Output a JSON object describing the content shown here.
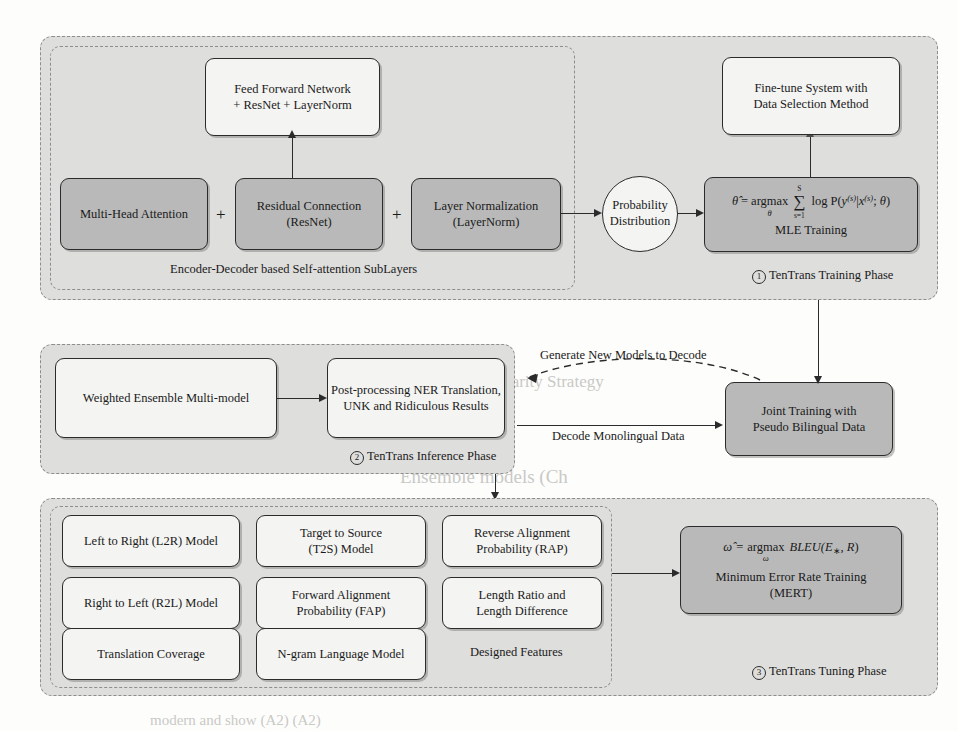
{
  "phase1": {
    "caption_number": "1",
    "caption": "TenTrans Training Phase",
    "subgroup_caption": "Encoder-Decoder based Self-attention SubLayers",
    "boxes": {
      "feed_forward": "Feed Forward Network\n+ ResNet + LayerNorm",
      "feed_forward_l1": "Feed Forward Network",
      "feed_forward_l2": "+ ResNet + LayerNorm",
      "multi_head": "Multi-Head Attention",
      "residual_l1": "Residual Connection",
      "residual_l2": "(ResNet)",
      "layernorm_l1": "Layer Normalization",
      "layernorm_l2": "(LayerNorm)",
      "finetune_l1": "Fine-tune System with",
      "finetune_l2": "Data Selection Method",
      "prob_l1": "Probability",
      "prob_l2": "Distribution",
      "mle_caption": "MLE Training"
    },
    "operators": {
      "plus1": "+",
      "plus2": "+"
    },
    "mle_formula": {
      "theta_hat": "θ̂",
      "equals": "=",
      "argmax": "argmax",
      "argmax_under": "θ",
      "sum": "∑",
      "sum_top": "S",
      "sum_bottom": "s=1",
      "log": "log",
      "body": "P(y(s)|x(s); θ)"
    }
  },
  "phase2": {
    "caption_number": "2",
    "caption": "TenTrans Inference Phase",
    "boxes": {
      "ensemble": "Weighted Ensemble Multi-model",
      "postproc_l1": "Post-processing NER Translation,",
      "postproc_l2": "UNK and Ridiculous Results"
    }
  },
  "joint": {
    "box_l1": "Joint Training with",
    "box_l2": "Pseudo Bilingual Data"
  },
  "edges": {
    "generate_models": "Generate New Models to Decode",
    "decode_mono": "Decode Monolingual Data"
  },
  "phase3": {
    "caption_number": "3",
    "caption": "TenTrans Tuning Phase",
    "subgroup_caption": "Designed Features",
    "features": [
      {
        "l1": "Left to Right (L2R) Model",
        "l2": ""
      },
      {
        "l1": "Target to Source",
        "l2": "(T2S) Model"
      },
      {
        "l1": "Reverse Alignment",
        "l2": "Probability (RAP)"
      },
      {
        "l1": "Right to Left (R2L) Model",
        "l2": ""
      },
      {
        "l1": "Forward Alignment",
        "l2": "Probability (FAP)"
      },
      {
        "l1": "Length Ratio and",
        "l2": "Length Difference"
      },
      {
        "l1": "Translation Coverage",
        "l2": ""
      },
      {
        "l1": "N-gram Language Model",
        "l2": ""
      }
    ],
    "mert": {
      "omega_hat": "ω̂",
      "equals": "=",
      "argmax": "argmax",
      "argmax_under": "ω",
      "body": "BLEU(E∗, R)",
      "caption_l1": "Minimum Error Rate Training",
      "caption_l2": "(MERT)"
    }
  },
  "colors": {
    "shaded_box": "#b9b9b9",
    "light_box": "#f4f4f2",
    "phase_bg": "#dededc",
    "stroke": "#2b2b2b",
    "dashed": "#8d8d8d",
    "page_bg": "#fdfdfc"
  },
  "ghost_text": [
    {
      "t": "is evaluated on the",
      "x": 300,
      "y": 58,
      "s": 15
    },
    {
      "t": "and multilingual",
      "x": 560,
      "y": 58,
      "s": 15
    },
    {
      "t": "system would be used for this task",
      "x": 200,
      "y": 86,
      "s": 16
    },
    {
      "t": "in the below experimental sections",
      "x": 200,
      "y": 112,
      "s": 16
    },
    {
      "t": "4   Multi-granularity Strategy",
      "x": 412,
      "y": 372,
      "s": 17
    },
    {
      "t": "We",
      "x": 412,
      "y": 404,
      "s": 15
    },
    {
      "t": "Ensemble models (Ch",
      "x": 400,
      "y": 466,
      "s": 19
    },
    {
      "t": "model",
      "x": 640,
      "y": 560,
      "s": 14
    },
    {
      "t": "we use the same setting",
      "x": 560,
      "y": 624,
      "s": 15
    },
    {
      "t": "when t",
      "x": 560,
      "y": 650,
      "s": 15
    },
    {
      "t": "modern and show (A2) (A2)",
      "x": 150,
      "y": 712,
      "s": 15
    }
  ]
}
